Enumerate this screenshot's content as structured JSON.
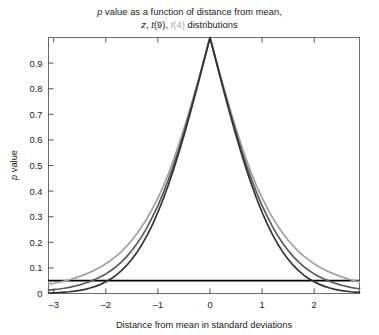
{
  "chart_data": {
    "type": "line",
    "title": "p value as a function of distance from mean, z, t(9), t(4) distributions",
    "title_lines": [
      {
        "parts": [
          {
            "text": "p",
            "style": "italic"
          },
          {
            "text": " value as a function of distance from mean,",
            "style": "normal"
          }
        ]
      },
      {
        "parts": [
          {
            "text": "z",
            "style": "italic"
          },
          {
            "text": ", ",
            "style": "normal"
          },
          {
            "text": "t",
            "style": "italic"
          },
          {
            "text": "(9), ",
            "style": "normal"
          },
          {
            "text": "t",
            "style": "italic-light"
          },
          {
            "text": "(4)",
            "style": "light"
          },
          {
            "text": " distributions",
            "style": "normal"
          }
        ]
      }
    ],
    "xlabel": "Distance from mean in standard deviations",
    "ylabel": "p value",
    "ylabel_italic_prefix": "p",
    "ylabel_rest": " value",
    "xlim": [
      -3.1,
      2.87
    ],
    "ylim": [
      0,
      1.0
    ],
    "xticks": [
      -3,
      -2,
      -1,
      0,
      1,
      2
    ],
    "xticklabels": [
      "–3",
      "–2",
      "–1",
      "0",
      "1",
      "2"
    ],
    "yticks": [
      0,
      0.1,
      0.2,
      0.3,
      0.4,
      0.5,
      0.6,
      0.7,
      0.8,
      0.9
    ],
    "yticklabels": [
      "0",
      "0.1",
      "0.2",
      "0.3",
      "0.4",
      "0.5",
      "0.6",
      "0.7",
      "0.8",
      "0.9"
    ],
    "grid": false,
    "legend": "none",
    "colors": {
      "z": "#333333",
      "t9": "#5a5a5a",
      "t4": "#a0a0a0",
      "alpha_line": "#000000",
      "axis": "#555555",
      "background": "#ffffff"
    },
    "x": [
      -3.1,
      -3.0,
      -2.9,
      -2.8,
      -2.7,
      -2.6,
      -2.5,
      -2.4,
      -2.3,
      -2.2,
      -2.1,
      -2.0,
      -1.9,
      -1.8,
      -1.7,
      -1.6,
      -1.5,
      -1.4,
      -1.3,
      -1.2,
      -1.1,
      -1.0,
      -0.9,
      -0.8,
      -0.7,
      -0.6,
      -0.5,
      -0.4,
      -0.3,
      -0.2,
      -0.1,
      0.0,
      0.1,
      0.2,
      0.3,
      0.4,
      0.5,
      0.6,
      0.7,
      0.8,
      0.9,
      1.0,
      1.1,
      1.2,
      1.3,
      1.4,
      1.5,
      1.6,
      1.7,
      1.8,
      1.9,
      2.0,
      2.1,
      2.2,
      2.3,
      2.4,
      2.5,
      2.6,
      2.7,
      2.8,
      2.87
    ],
    "series": [
      {
        "name": "z",
        "label": "z",
        "color": "#333333",
        "values": [
          0.0019,
          0.0027,
          0.0037,
          0.0051,
          0.0069,
          0.0093,
          0.0124,
          0.0164,
          0.0214,
          0.0278,
          0.0357,
          0.0455,
          0.0574,
          0.0719,
          0.0891,
          0.1096,
          0.1336,
          0.1615,
          0.1936,
          0.2301,
          0.2713,
          0.3173,
          0.3681,
          0.4237,
          0.4839,
          0.5485,
          0.6171,
          0.6892,
          0.7642,
          0.8415,
          0.9203,
          1.0,
          0.9203,
          0.8415,
          0.7642,
          0.6892,
          0.6171,
          0.5485,
          0.4839,
          0.4237,
          0.3681,
          0.3173,
          0.2713,
          0.2301,
          0.1936,
          0.1615,
          0.1336,
          0.1096,
          0.0891,
          0.0719,
          0.0574,
          0.0455,
          0.0357,
          0.0278,
          0.0214,
          0.0164,
          0.0124,
          0.0093,
          0.0069,
          0.0051,
          0.0041
        ]
      },
      {
        "name": "t9",
        "label": "t(9)",
        "color": "#5a5a5a",
        "values": [
          0.0128,
          0.015,
          0.0175,
          0.0205,
          0.0241,
          0.0285,
          0.0338,
          0.04,
          0.0473,
          0.0556,
          0.0653,
          0.0766,
          0.0898,
          0.1051,
          0.1232,
          0.1442,
          0.1681,
          0.195,
          0.226,
          0.2614,
          0.3011,
          0.3434,
          0.3913,
          0.4442,
          0.5009,
          0.5613,
          0.6291,
          0.6985,
          0.7714,
          0.8463,
          0.9225,
          1.0,
          0.9225,
          0.8463,
          0.7714,
          0.6985,
          0.6291,
          0.5613,
          0.5009,
          0.4442,
          0.3913,
          0.3434,
          0.3011,
          0.2614,
          0.226,
          0.195,
          0.1681,
          0.1442,
          0.1232,
          0.1051,
          0.0898,
          0.0766,
          0.0653,
          0.0556,
          0.0473,
          0.04,
          0.0338,
          0.0285,
          0.0241,
          0.0205,
          0.0187
        ]
      },
      {
        "name": "t4",
        "label": "t(4)",
        "color": "#a0a0a0",
        "values": [
          0.0364,
          0.0399,
          0.044,
          0.0486,
          0.0538,
          0.0598,
          0.0668,
          0.0746,
          0.0829,
          0.0928,
          0.1037,
          0.1161,
          0.1302,
          0.1459,
          0.164,
          0.1849,
          0.208,
          0.2343,
          0.2646,
          0.2965,
          0.3331,
          0.3739,
          0.417,
          0.4671,
          0.5222,
          0.5808,
          0.6433,
          0.7102,
          0.7799,
          0.851,
          0.9251,
          1.0,
          0.9251,
          0.851,
          0.7799,
          0.7102,
          0.6433,
          0.5808,
          0.5222,
          0.4671,
          0.417,
          0.3739,
          0.3331,
          0.2965,
          0.2646,
          0.2343,
          0.208,
          0.1849,
          0.164,
          0.1459,
          0.1302,
          0.1161,
          0.1037,
          0.0928,
          0.0829,
          0.0746,
          0.0668,
          0.0598,
          0.0538,
          0.0486,
          0.0464
        ]
      }
    ],
    "reference_lines": [
      {
        "name": "alpha-0.05",
        "orientation": "horizontal",
        "value": 0.05,
        "color": "#000000",
        "width": 1.8
      }
    ],
    "annotations": {
      "critical_values": {
        "z": 1.96,
        "t9": 2.262,
        "t4": 2.776
      }
    }
  }
}
